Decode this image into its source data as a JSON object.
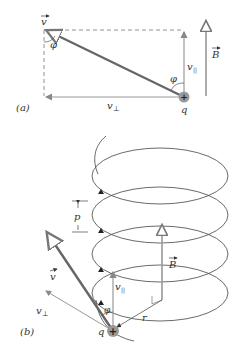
{
  "figure": {
    "part_a": {
      "label": "(a)",
      "v_label": "v",
      "phi_top": "φ",
      "phi_bottom": "φ",
      "v_parallel": "v",
      "v_parallel_sub": "||",
      "v_perp": "v",
      "v_perp_sub": "⊥",
      "B_label": "B",
      "q_label": "q"
    },
    "part_b": {
      "label": "(b)",
      "p_label": "p",
      "v_label": "v",
      "v_parallel": "v",
      "v_parallel_sub": "||",
      "v_perp": "v",
      "v_perp_sub": "⊥",
      "phi_label": "φ",
      "B_label": "B",
      "r_label": "r",
      "q_label": "q"
    },
    "colors": {
      "line_dark": "#555555",
      "line_gray": "#9a9a9a",
      "charge": "#888888"
    }
  }
}
